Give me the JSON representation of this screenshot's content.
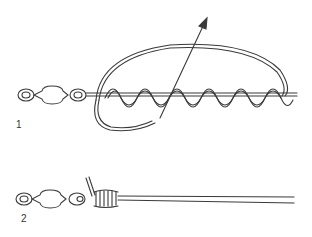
{
  "figure": {
    "steps": [
      {
        "label": "1",
        "description": "Tag end wrapped in coils along line and passed back through loop; arrow shows pulling direction"
      },
      {
        "label": "2",
        "description": "Knot tightened against swivel eye"
      }
    ],
    "colors": {
      "stroke": "#3a3a3a",
      "background": "#ffffff"
    }
  }
}
